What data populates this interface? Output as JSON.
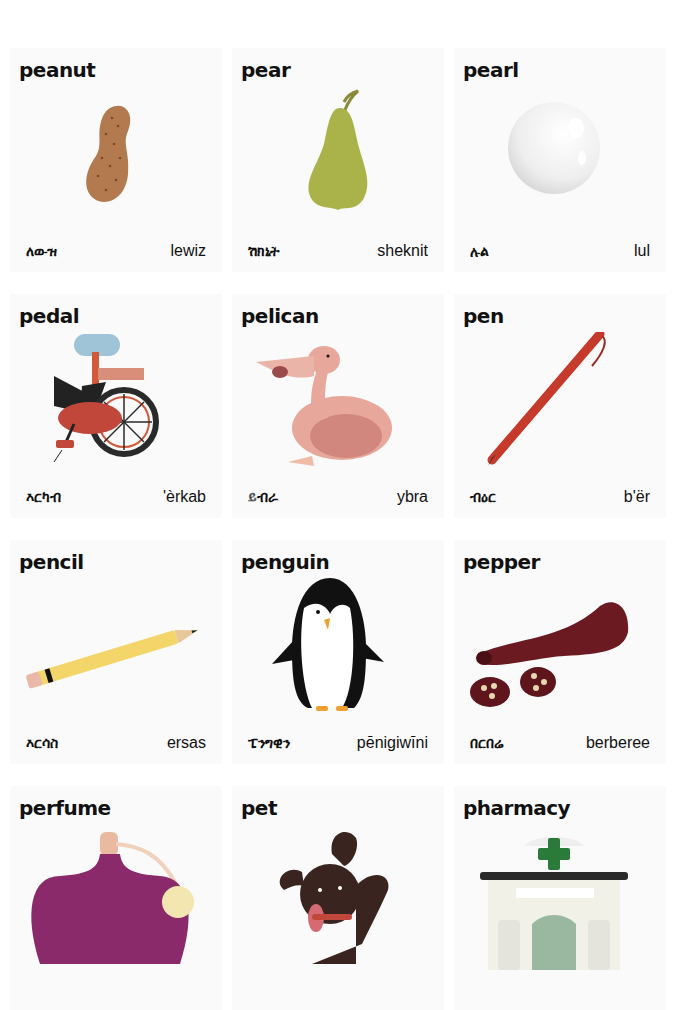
{
  "page": {
    "type": "picture-dictionary"
  },
  "entries": [
    {
      "word": "peanut",
      "amharic": "ለውዝ",
      "transliteration": "lewiz",
      "icon": "peanut-icon"
    },
    {
      "word": "pear",
      "amharic": "ሽክኒት",
      "transliteration": "sheknit",
      "icon": "pear-icon"
    },
    {
      "word": "pearl",
      "amharic": "ሉል",
      "transliteration": "lul",
      "icon": "pearl-icon"
    },
    {
      "word": "pedal",
      "amharic": "እርካብ",
      "transliteration": "'èrkab",
      "icon": "bicycle-pedal-icon"
    },
    {
      "word": "pelican",
      "amharic": "ይብራ",
      "transliteration": "ybra",
      "icon": "pelican-icon"
    },
    {
      "word": "pen",
      "amharic": "ብዕር",
      "transliteration": "b'ër",
      "icon": "pen-icon"
    },
    {
      "word": "pencil",
      "amharic": "እርሳስ",
      "transliteration": "ersas",
      "icon": "pencil-icon"
    },
    {
      "word": "penguin",
      "amharic": "ፔንግዊን",
      "transliteration": "pēnigiwīni",
      "icon": "penguin-icon"
    },
    {
      "word": "pepper",
      "amharic": "በርበሬ",
      "transliteration": "berberee",
      "icon": "pepper-icon"
    },
    {
      "word": "perfume",
      "icon": "perfume-bottle-icon"
    },
    {
      "word": "pet",
      "icon": "dog-icon"
    },
    {
      "word": "pharmacy",
      "icon": "pharmacy-icon"
    }
  ],
  "colors": {
    "peanut": "#b27a4e",
    "pear": "#a9b349",
    "pearl": "#f4f4f4",
    "bike_seat": "#9fc4d8",
    "bike_frame": "#d05a3a",
    "bike_wheel": "#2a2a2a",
    "pelican": "#e7a79b",
    "pen": "#c63a2c",
    "pencil": "#f3d56a",
    "penguin": "#111111",
    "penguin_beak": "#f0a030",
    "pepper": "#6b1a22",
    "perfume": "#8a2a6a",
    "pet": "#3a2420",
    "pharmacy_cross": "#2a7a3a"
  }
}
